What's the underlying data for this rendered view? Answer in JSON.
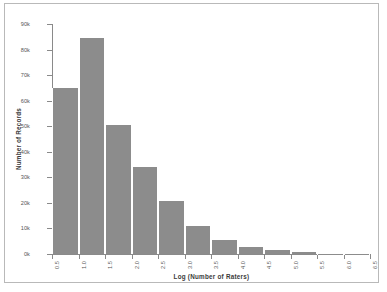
{
  "chart_data": {
    "type": "bar",
    "title": "",
    "xlabel": "Log (Number of Raters)",
    "ylabel": "Number of Records",
    "xlim": [
      0.5,
      6.5
    ],
    "ylim": [
      0,
      90000
    ],
    "grid": false,
    "legend": null,
    "bin_width": 0.5,
    "bin_edges": [
      0.5,
      1.0,
      1.5,
      2.0,
      2.5,
      3.0,
      3.5,
      4.0,
      4.5,
      5.0,
      5.5,
      6.0,
      6.5
    ],
    "x_tick_labels": [
      "0.5",
      "1.0",
      "1.5",
      "2.0",
      "2.5",
      "3.0",
      "3.5",
      "4.0",
      "4.5",
      "5.0",
      "5.5",
      "6.0",
      "6.5"
    ],
    "y_tick_labels": [
      "0k",
      "10k",
      "20k",
      "30k",
      "40k",
      "50k",
      "60k",
      "70k",
      "80k",
      "90k"
    ],
    "y_tick_values": [
      0,
      10000,
      20000,
      30000,
      40000,
      50000,
      60000,
      70000,
      80000,
      90000
    ],
    "categories": [
      "0.5-1.0",
      "1.0-1.5",
      "1.5-2.0",
      "2.0-2.5",
      "2.5-3.0",
      "3.0-3.5",
      "3.5-4.0",
      "4.0-4.5",
      "4.5-5.0",
      "5.0-5.5",
      "5.5-6.0",
      "6.0-6.5"
    ],
    "values": [
      65000,
      84500,
      50500,
      34000,
      20800,
      10800,
      5500,
      2700,
      1500,
      700,
      150,
      40
    ],
    "bar_color": "#8c8c8c",
    "bar_edge_color": "#ffffff",
    "axis_color": "#8a8a8a",
    "frame_color": "#b9b9b9",
    "background_color": "#ffffff"
  }
}
